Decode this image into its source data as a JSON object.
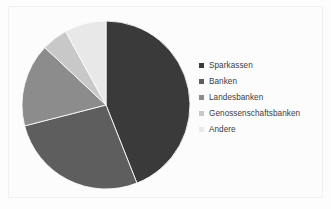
{
  "chart_data": {
    "type": "pie",
    "title": "",
    "subtitle": "",
    "xlabel": "",
    "ylabel": "",
    "grid": false,
    "legend_position": "right",
    "start_angle_deg": 0,
    "direction": "clockwise",
    "categories": [
      "Sparkassen",
      "Banken",
      "Landesbanken",
      "Genossenschaftsbanken",
      "Andere"
    ],
    "values": [
      44,
      27,
      16,
      5,
      8
    ],
    "unit": "%",
    "colors": [
      "#3a3a3a",
      "#5e5e5e",
      "#8c8c8c",
      "#c8c8c8",
      "#e8e8e8"
    ],
    "slices": [
      {
        "label": "Sparkassen",
        "value": 44,
        "color": "#3a3a3a"
      },
      {
        "label": "Banken",
        "value": 27,
        "color": "#5e5e5e"
      },
      {
        "label": "Landesbanken",
        "value": 16,
        "color": "#8c8c8c"
      },
      {
        "label": "Genossenschaftsbanken",
        "value": 5,
        "color": "#c8c8c8"
      },
      {
        "label": "Andere",
        "value": 8,
        "color": "#e8e8e8"
      }
    ]
  },
  "legend": {
    "items": [
      {
        "label": "Sparkassen",
        "color": "#3a3a3a"
      },
      {
        "label": "Banken",
        "color": "#5e5e5e"
      },
      {
        "label": "Landesbanken",
        "color": "#8c8c8c"
      },
      {
        "label": "Genossenschaftsbanken",
        "color": "#c8c8c8"
      },
      {
        "label": "Andere",
        "color": "#e8e8e8"
      }
    ]
  },
  "figure": {
    "background_color": "#fdfdfd",
    "border_color": "#f0f0f0"
  }
}
